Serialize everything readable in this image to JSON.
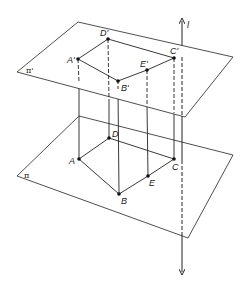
{
  "diagram": {
    "type": "3d-geometry-projection",
    "colors": {
      "stroke": "#222222",
      "background": "#ffffff"
    },
    "planes": [
      {
        "id": "upper",
        "label": "π'"
      },
      {
        "id": "lower",
        "label": "π"
      }
    ],
    "line": {
      "label": "l"
    },
    "upper_points": [
      {
        "label": "A'"
      },
      {
        "label": "B'"
      },
      {
        "label": "C'"
      },
      {
        "label": "D'"
      },
      {
        "label": "E'"
      }
    ],
    "lower_points": [
      {
        "label": "A"
      },
      {
        "label": "B"
      },
      {
        "label": "C"
      },
      {
        "label": "D"
      },
      {
        "label": "E"
      }
    ]
  }
}
